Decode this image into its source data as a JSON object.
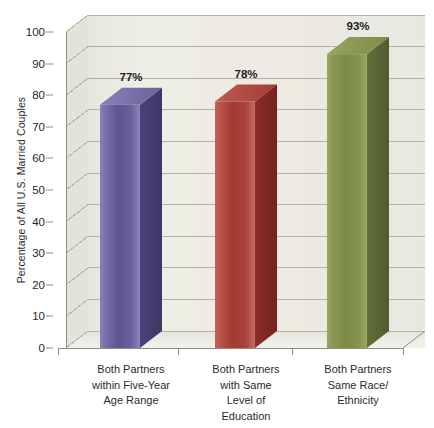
{
  "chart_data": {
    "type": "bar",
    "title": "",
    "xlabel": "",
    "ylabel": "Percentage of All U.S. Married Couples",
    "ylim": [
      0,
      100
    ],
    "ytick_step": 10,
    "yticks": [
      0,
      10,
      20,
      30,
      40,
      50,
      60,
      70,
      80,
      90,
      100
    ],
    "ytick_labels": [
      "0",
      "10",
      "20",
      "30",
      "40",
      "50",
      "60",
      "70",
      "80",
      "90",
      "100"
    ],
    "grid": true,
    "grid_axis": "y",
    "legend": "none",
    "three_d": true,
    "categories": [
      "Both Partners within Five-Year Age Range",
      "Both Partners with Same Level of Education",
      "Both Partners Same Race/ Ethnicity"
    ],
    "category_lines": [
      [
        "Both Partners",
        "within Five-Year",
        "Age Range"
      ],
      [
        "Both Partners",
        "with Same",
        "Level of",
        "Education"
      ],
      [
        "Both Partners",
        "Same Race/",
        "Ethnicity"
      ]
    ],
    "values": [
      77,
      78,
      93
    ],
    "data_labels": [
      "77%",
      "78%",
      "93%"
    ],
    "bar_colors": [
      "#5f5698",
      "#a83a33",
      "#7f8f45"
    ],
    "bar_color_names": [
      "purple",
      "red",
      "olive-green"
    ]
  },
  "style": {
    "plot_background": "#edece4",
    "panel_outer_background": "#ffffff",
    "gridline_color": "#b4b2a4",
    "axis_color": "#8d8d84",
    "text_color": "#2b2b2b"
  }
}
